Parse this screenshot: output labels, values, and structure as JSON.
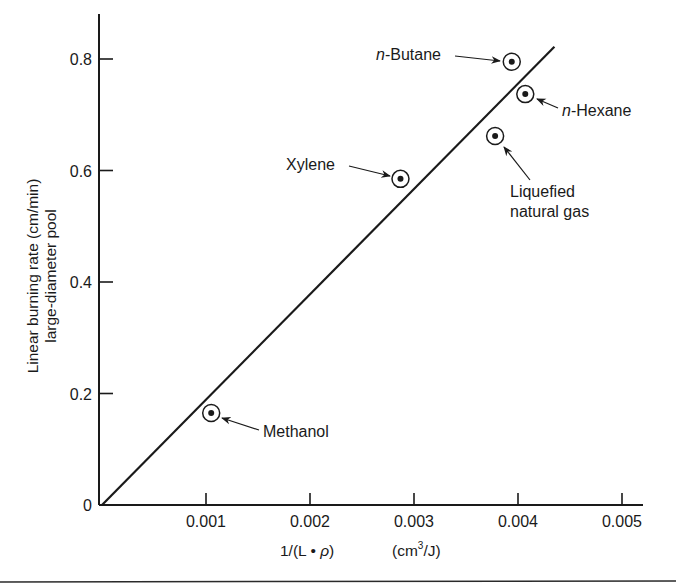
{
  "chart_data": {
    "type": "scatter",
    "title": "",
    "xlabel": "1/(L • ρ)    (cm³/J)",
    "xlabel_parts": {
      "main": "1/(L • ",
      "rho": "ρ",
      "close": ")",
      "unit_open": "(cm",
      "unit_sup": "3",
      "unit_close": "/J)"
    },
    "ylabel": "Linear burning rate (cm/min) large-diameter pool",
    "ylabel_lines": [
      "Linear burning rate (cm/min)",
      "large-diameter pool"
    ],
    "xlim": [
      0,
      0.0052
    ],
    "ylim": [
      0,
      0.85
    ],
    "x_ticks": [
      0.001,
      0.002,
      0.003,
      0.004,
      0.005
    ],
    "x_tick_labels": [
      "0.001",
      "0.002",
      "0.003",
      "0.004",
      "0.005"
    ],
    "y_ticks": [
      0,
      0.2,
      0.4,
      0.6,
      0.8
    ],
    "y_tick_labels": [
      "0",
      "0.2",
      "0.4",
      "0.6",
      "0.8"
    ],
    "grid": false,
    "legend": null,
    "series": [
      {
        "name": "Fuels",
        "marker": "circled-dot",
        "points": [
          {
            "label": "Methanol",
            "x": 0.00105,
            "y": 0.165
          },
          {
            "label": "Xylene",
            "x": 0.00287,
            "y": 0.585
          },
          {
            "label": "Liquefied natural gas",
            "x": 0.00378,
            "y": 0.662
          },
          {
            "label": "n-Butane",
            "x": 0.00394,
            "y": 0.795
          },
          {
            "label": "n-Hexane",
            "x": 0.00407,
            "y": 0.737
          }
        ]
      },
      {
        "name": "Linear fit",
        "type": "line",
        "x": [
          0,
          0.00435
        ],
        "y": [
          0,
          0.822
        ]
      }
    ],
    "annotations": [
      {
        "text_italic": "n",
        "text": "-Butane",
        "points_to": "n-Butane"
      },
      {
        "text_italic": "n",
        "text": "-Hexane",
        "points_to": "n-Hexane"
      },
      {
        "text": "Xylene",
        "points_to": "Xylene"
      },
      {
        "text_lines": [
          "Liquefied",
          "natural gas"
        ],
        "points_to": "Liquefied natural gas"
      },
      {
        "text": "Methanol",
        "points_to": "Methanol"
      }
    ]
  },
  "colors": {
    "ink": "#1a1a1a",
    "background": "#ffffff"
  }
}
